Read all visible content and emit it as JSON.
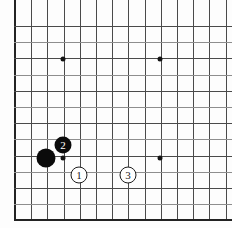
{
  "figure": {
    "kind": "go-board-diagram",
    "background_color": "#fdfdfd",
    "line_color": "#4a4a4a",
    "border_color": "#232323",
    "black_stone_color": "#0b0b0b",
    "white_stone_color": "#ffffff",
    "star_point_color": "#141414"
  },
  "board": {
    "cell_size": 16.2,
    "origin_x": 15,
    "origin_y": 26,
    "columns": 14,
    "rows": 12,
    "left_edge_is_board_border": true,
    "bottom_edge_is_board_border": true,
    "top_edge_is_board_border": false,
    "right_edge_is_board_border": false,
    "star_points": [
      {
        "x": 63,
        "y": 59
      },
      {
        "x": 160,
        "y": 59
      },
      {
        "x": 63,
        "y": 158
      },
      {
        "x": 160,
        "y": 158
      }
    ]
  },
  "stones": [
    {
      "color": "black",
      "label": "",
      "x": 46,
      "y": 158,
      "radius": 9.5,
      "font_size": 0
    },
    {
      "color": "black",
      "label": "2",
      "x": 63,
      "y": 145,
      "radius": 8.5,
      "font_size": 11
    },
    {
      "color": "white",
      "label": "1",
      "x": 79,
      "y": 175,
      "radius": 8.5,
      "font_size": 11
    },
    {
      "color": "white",
      "label": "3",
      "x": 128,
      "y": 175,
      "radius": 8.5,
      "font_size": 11
    }
  ]
}
